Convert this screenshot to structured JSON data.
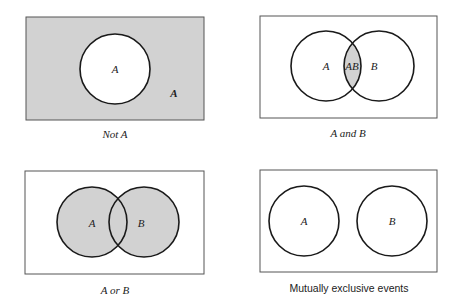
{
  "colors": {
    "shade": "#d2d2d2",
    "stroke": "#1a1a1a",
    "frame": "#555555",
    "background": "#ffffff"
  },
  "panels": [
    {
      "id": "not-a",
      "caption": "Not A",
      "labels": {
        "inside": "A",
        "outside": "A"
      }
    },
    {
      "id": "a-and-b",
      "caption": "A and B",
      "labels": {
        "a": "A",
        "ab": "AB",
        "b": "B"
      }
    },
    {
      "id": "a-or-b",
      "caption": "A or B",
      "labels": {
        "a": "A",
        "b": "B"
      }
    },
    {
      "id": "mutually-exclusive",
      "caption": "Mutually exclusive events",
      "labels": {
        "a": "A",
        "b": "B"
      }
    }
  ]
}
